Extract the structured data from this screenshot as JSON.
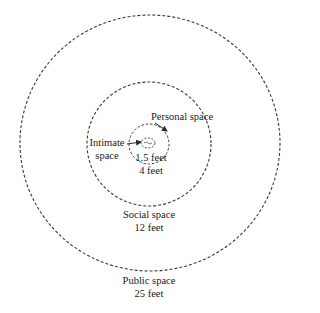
{
  "diagram": {
    "colors": {
      "stroke": "#3a3a3a",
      "text": "#1a1a1a",
      "background": "#ffffff"
    },
    "zones": [
      {
        "id": "intimate",
        "name": "Intimate space",
        "label_line1": "Intimate",
        "label_line2": "space",
        "distance": "1.5 feet"
      },
      {
        "id": "personal",
        "name": "Personal space",
        "label_line1": "Personal space",
        "distance": "4 feet"
      },
      {
        "id": "social",
        "name": "Social space",
        "label_line1": "Social space",
        "distance": "12 feet"
      },
      {
        "id": "public",
        "name": "Public space",
        "label_line1": "Public space",
        "distance": "25 feet"
      }
    ]
  }
}
